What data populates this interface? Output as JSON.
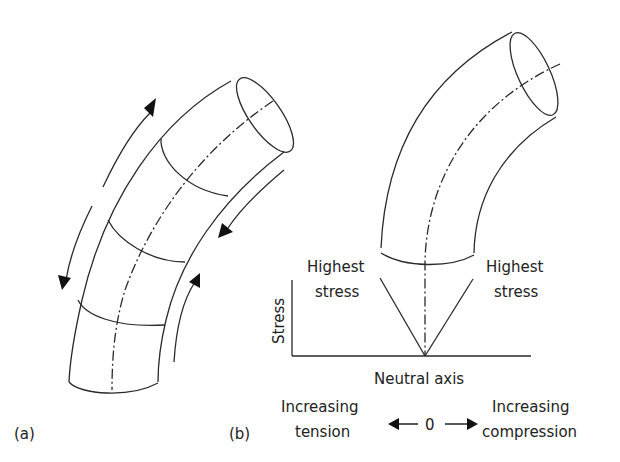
{
  "figure": {
    "panel_a": {
      "label": "(a)"
    },
    "panel_b": {
      "label": "(b)",
      "labels": {
        "highest_stress_left_line1": "Highest",
        "highest_stress_left_line2": "stress",
        "highest_stress_right_line1": "Highest",
        "highest_stress_right_line2": "stress",
        "y_axis": "Stress",
        "neutral_axis": "Neutral axis",
        "left_dir_line1": "Increasing",
        "left_dir_line2": "tension",
        "zero": "0",
        "right_dir_line1": "Increasing",
        "right_dir_line2": "compression"
      }
    }
  }
}
